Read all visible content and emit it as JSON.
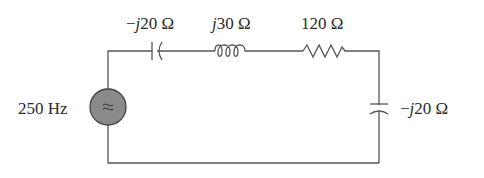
{
  "diagram": {
    "type": "series RLC AC circuit",
    "source": {
      "label": "250 Hz",
      "symbol": "≈",
      "fill": "#8a8a8a"
    },
    "components": [
      {
        "id": "c1",
        "kind": "capacitor",
        "label_prefix": "−",
        "label_j": "j",
        "label_value": "20 Ω",
        "position": "top-left"
      },
      {
        "id": "l1",
        "kind": "inductor",
        "label_prefix": "",
        "label_j": "j",
        "label_value": "30 Ω",
        "position": "top-middle"
      },
      {
        "id": "r1",
        "kind": "resistor",
        "label_value": "120 Ω",
        "position": "top-right"
      },
      {
        "id": "c2",
        "kind": "capacitor",
        "label_prefix": "−",
        "label_j": "j",
        "label_value": "20 Ω",
        "position": "right"
      }
    ],
    "wire_color": "#555555"
  }
}
